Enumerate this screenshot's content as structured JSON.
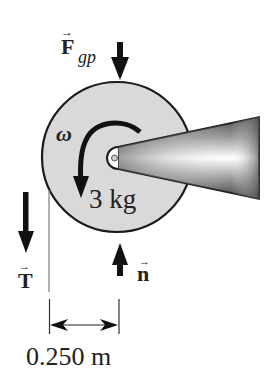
{
  "diagram": {
    "type": "free-body-diagram",
    "object": {
      "shape": "disk",
      "mass_label": "3 kg",
      "fill_color": "#d9d9d9",
      "outline_color": "#1a1a1a"
    },
    "axle": {
      "shape": "tapered-cone",
      "colors": {
        "edge": "#3a3a3a",
        "mid": "#8c8c8c",
        "highlight": "#ffffff"
      }
    },
    "rotation": {
      "symbol": "ω",
      "direction": "counterclockwise"
    },
    "forces": [
      {
        "id": "gravity",
        "symbol": "F",
        "subscript": "gp",
        "vector": true,
        "direction": "down",
        "location": "top of disk center"
      },
      {
        "id": "tension",
        "symbol": "T",
        "vector": true,
        "direction": "down",
        "location": "left edge of disk"
      },
      {
        "id": "normal",
        "symbol": "n",
        "vector": true,
        "direction": "up",
        "location": "below disk center"
      }
    ],
    "dimension": {
      "label": "0.250 m",
      "description": "distance from left edge of disk to axle center"
    },
    "vector_arrow_glyph": "→"
  }
}
